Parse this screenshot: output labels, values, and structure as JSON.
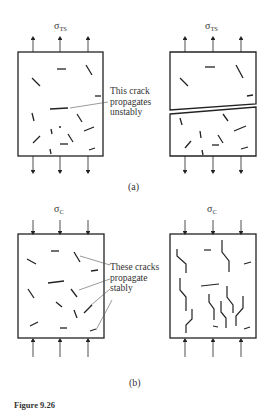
{
  "figure": {
    "caption": "Figure 9.26"
  },
  "panel_a": {
    "label": "(a)",
    "stress_symbol": "σ",
    "stress_subscript": "TS",
    "annotation": [
      "This crack",
      "propagates",
      "unstably"
    ]
  },
  "panel_b": {
    "label": "(b)",
    "stress_symbol": "σ",
    "stress_subscript": "C",
    "annotation": [
      "These cracks",
      "propagate",
      "stably"
    ]
  },
  "colors": {
    "line": "#222222",
    "leader": "#555555",
    "background": "#ffffff"
  }
}
